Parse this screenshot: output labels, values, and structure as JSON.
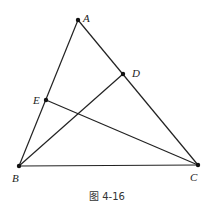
{
  "figure": {
    "caption": "图 4-16",
    "points": {
      "A": {
        "label": "A",
        "x": 78,
        "y": 20,
        "lx": 83,
        "ly": 19
      },
      "B": {
        "label": "B",
        "x": 19,
        "y": 166,
        "lx": 12,
        "ly": 182
      },
      "C": {
        "label": "C",
        "x": 198,
        "y": 165,
        "lx": 190,
        "ly": 181
      },
      "D": {
        "label": "D",
        "x": 123,
        "y": 74,
        "lx": 132,
        "ly": 75
      },
      "E": {
        "label": "E",
        "x": 46,
        "y": 100,
        "lx": 33,
        "ly": 103
      }
    },
    "segments": [
      [
        "A",
        "B"
      ],
      [
        "A",
        "C"
      ],
      [
        "B",
        "C"
      ],
      [
        "B",
        "D"
      ],
      [
        "C",
        "E"
      ]
    ]
  }
}
